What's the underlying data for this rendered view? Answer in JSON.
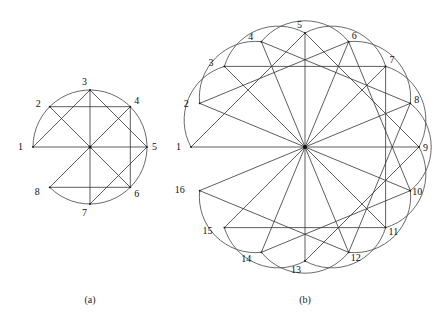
{
  "figure": {
    "panels": [
      {
        "id": "a",
        "caption": "(a)",
        "caption_pos": [
          90,
          303
        ],
        "center": [
          90,
          147
        ],
        "radius": 57,
        "start_angle_deg": 180,
        "step_deg": 45,
        "labels": [
          "1",
          "2",
          "3",
          "4",
          "5",
          "6",
          "7",
          "8"
        ],
        "label_offsets": [
          [
            -10,
            3
          ],
          [
            -9,
            0
          ],
          [
            -3,
            -5
          ],
          [
            4,
            -3
          ],
          [
            5,
            3
          ],
          [
            4,
            10
          ],
          [
            -3,
            12
          ],
          [
            -10,
            8
          ]
        ],
        "chords": [
          [
            1,
            3
          ],
          [
            2,
            4
          ],
          [
            3,
            5
          ],
          [
            4,
            6
          ],
          [
            5,
            7
          ],
          [
            6,
            8
          ],
          [
            1,
            5
          ],
          [
            2,
            6
          ],
          [
            3,
            7
          ],
          [
            4,
            8
          ]
        ],
        "outer_arc": {
          "from": 1,
          "to": 8,
          "sweep": "clockwise"
        },
        "arcs": [],
        "arc_radius": 0
      },
      {
        "id": "b",
        "caption": "(b)",
        "caption_pos": [
          305,
          303
        ],
        "center": [
          305,
          147
        ],
        "radius": 114,
        "start_angle_deg": 180,
        "step_deg": 22.5,
        "labels": [
          "1",
          "2",
          "3",
          "4",
          "5",
          "6",
          "7",
          "8",
          "9",
          "10",
          "11",
          "12",
          "13",
          "14",
          "15",
          "16"
        ],
        "label_offsets": [
          [
            -10,
            3
          ],
          [
            -11,
            4
          ],
          [
            -11,
            0
          ],
          [
            -8,
            -2
          ],
          [
            -3,
            -5
          ],
          [
            3,
            -3
          ],
          [
            4,
            -3
          ],
          [
            4,
            0
          ],
          [
            4,
            4
          ],
          [
            2,
            4
          ],
          [
            3,
            7
          ],
          [
            2,
            9
          ],
          [
            -4,
            12
          ],
          [
            -10,
            10
          ],
          [
            -12,
            6
          ],
          [
            -15,
            2
          ]
        ],
        "chords": [
          [
            1,
            5
          ],
          [
            2,
            6
          ],
          [
            3,
            7
          ],
          [
            4,
            8
          ],
          [
            5,
            9
          ],
          [
            6,
            10
          ],
          [
            7,
            11
          ],
          [
            8,
            12
          ],
          [
            9,
            13
          ],
          [
            10,
            14
          ],
          [
            11,
            15
          ],
          [
            12,
            16
          ],
          [
            1,
            9
          ],
          [
            2,
            10
          ],
          [
            3,
            11
          ],
          [
            4,
            12
          ],
          [
            5,
            13
          ],
          [
            6,
            14
          ],
          [
            7,
            15
          ],
          [
            8,
            16
          ]
        ],
        "outer_arc": null,
        "arcs": [
          [
            1,
            3
          ],
          [
            2,
            4
          ],
          [
            3,
            5
          ],
          [
            4,
            6
          ],
          [
            5,
            7
          ],
          [
            6,
            8
          ],
          [
            7,
            9
          ],
          [
            8,
            10
          ],
          [
            9,
            11
          ],
          [
            10,
            12
          ],
          [
            11,
            13
          ],
          [
            12,
            14
          ],
          [
            13,
            15
          ],
          [
            14,
            16
          ]
        ],
        "arc_radius": 56
      }
    ]
  }
}
